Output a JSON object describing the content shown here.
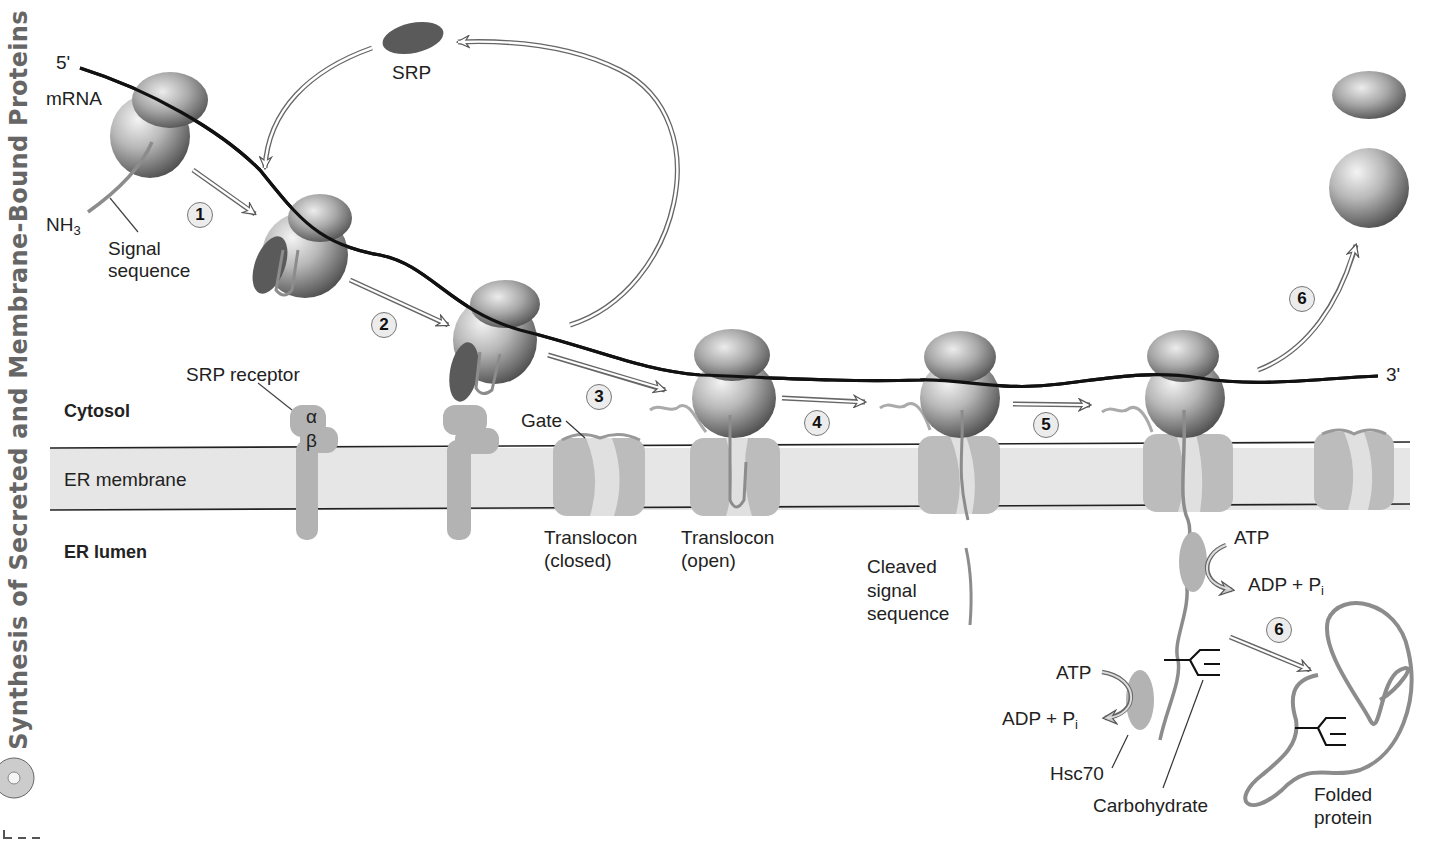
{
  "side_title": "Synthesis of Secreted and Membrane-Bound Proteins",
  "colors": {
    "membrane_fill": "#e6e6e6",
    "membrane_line": "#222222",
    "protein_gray": "#b3b3b3",
    "srp_dark": "#5a5a5a",
    "polypeptide": "#8c8c8c",
    "mrna": "#111111",
    "step_fill": "#ececec"
  },
  "labels": {
    "five_prime": "5'",
    "three_prime": "3'",
    "mrna": "mRNA",
    "srp": "SRP",
    "nh3": "NH",
    "nh3_sub": "3",
    "signal_sequence_1": "Signal",
    "signal_sequence_2": "sequence",
    "srp_receptor": "SRP receptor",
    "alpha": "α",
    "beta": "β",
    "cytosol": "Cytosol",
    "er_membrane": "ER membrane",
    "er_lumen": "ER lumen",
    "gate": "Gate",
    "translocon_closed_1": "Translocon",
    "translocon_closed_2": "(closed)",
    "translocon_open_1": "Translocon",
    "translocon_open_2": "(open)",
    "cleaved_1": "Cleaved",
    "cleaved_2": "signal",
    "cleaved_3": "sequence",
    "atp_upper": "ATP",
    "adp_upper": "ADP + P",
    "adp_upper_sub": "i",
    "atp_lower": "ATP",
    "adp_lower": "ADP + P",
    "adp_lower_sub": "i",
    "hsc70": "Hsc70",
    "carbohydrate": "Carbohydrate",
    "folded_1": "Folded",
    "folded_2": "protein"
  },
  "steps": [
    {
      "n": "1",
      "x": 187,
      "y": 202
    },
    {
      "n": "2",
      "x": 371,
      "y": 312
    },
    {
      "n": "3",
      "x": 586,
      "y": 384
    },
    {
      "n": "4",
      "x": 804,
      "y": 410
    },
    {
      "n": "5",
      "x": 1033,
      "y": 412
    },
    {
      "n": "6",
      "x": 1289,
      "y": 286
    },
    {
      "n": "6",
      "x": 1266,
      "y": 617
    }
  ]
}
